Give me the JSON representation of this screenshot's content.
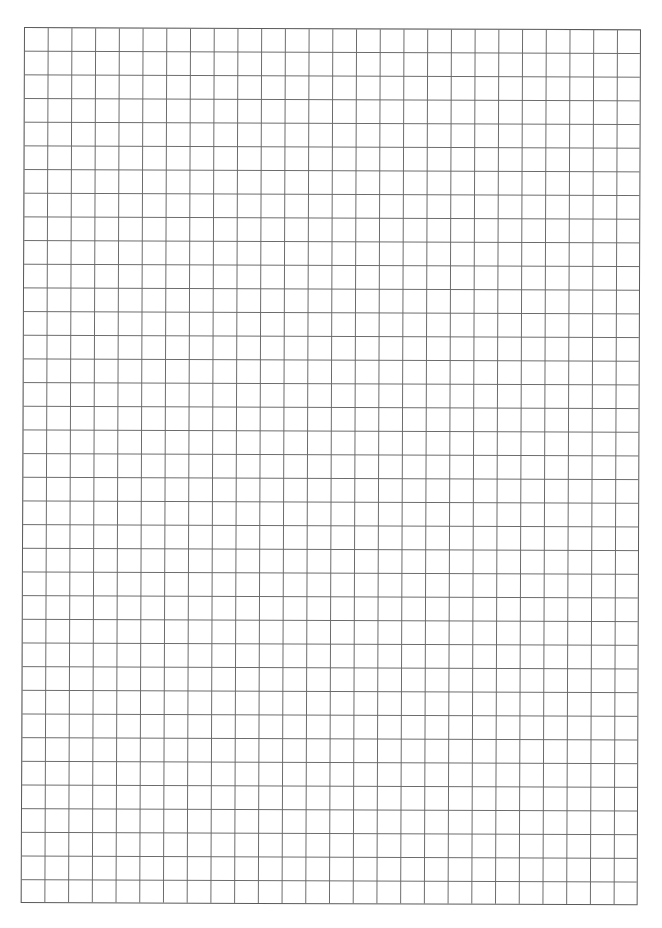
{
  "page": {
    "type": "graph-paper",
    "grid": {
      "columns": 26,
      "rows": 37,
      "line_color": "#6a6a6a",
      "border_color": "#5a5a5a",
      "background_color": "#ffffff"
    }
  }
}
